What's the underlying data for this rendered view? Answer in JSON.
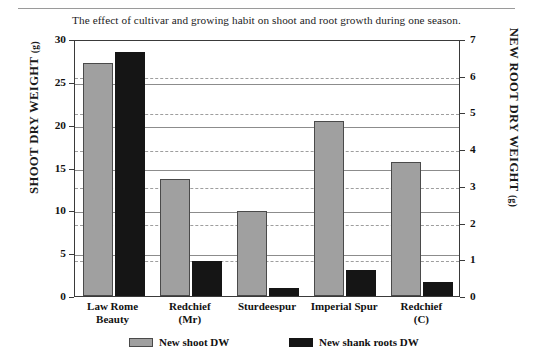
{
  "figure": {
    "caption": "The effect of cultivar and growing habit on shoot and root growth during one season."
  },
  "chart_data": {
    "type": "bar",
    "title": "The effect of cultivar and growing habit on shoot and root growth during one season.",
    "xlabel": "",
    "ylabel": "SHOOT DRY WEIGHT (g)",
    "y2label": "NEW ROOT DRY WEIGHT (g)",
    "categories": [
      "Law Rome Beauty",
      "Redchief (Mr)",
      "Sturdeespur",
      "Imperial Spur",
      "Redchief (C)"
    ],
    "category_lines": [
      [
        "Law Rome",
        "Beauty"
      ],
      [
        "Redchief",
        "(Mr)"
      ],
      [
        "Sturdeespur",
        ""
      ],
      [
        "Imperial Spur",
        ""
      ],
      [
        "Redchief",
        "(C)"
      ]
    ],
    "series": [
      {
        "name": "New shoot DW",
        "axis": "left",
        "color": "#a0a0a0",
        "values": [
          27.2,
          13.7,
          9.9,
          20.4,
          15.6
        ]
      },
      {
        "name": "New shank roots DW",
        "axis": "right",
        "color": "#151515",
        "values": [
          6.65,
          0.95,
          0.22,
          0.7,
          0.38
        ]
      }
    ],
    "ylim": [
      0,
      30
    ],
    "yticks": [
      0,
      5,
      10,
      15,
      20,
      25,
      30
    ],
    "y2lim": [
      0,
      7
    ],
    "y2ticks": [
      0,
      1,
      2,
      3,
      4,
      5,
      6,
      7
    ],
    "grid": {
      "left_axis_solid": true,
      "right_axis_dashed": true
    },
    "legend": {
      "position": "bottom",
      "entries": [
        "New shoot DW",
        "New shank roots DW"
      ]
    }
  },
  "axes": {
    "left": {
      "title_main": "SHOOT DRY WEIGHT",
      "title_unit": "(g)",
      "ticks": [
        "0",
        "5",
        "10",
        "15",
        "20",
        "25",
        "30"
      ]
    },
    "right": {
      "title_main": "NEW ROOT DRY WEIGHT",
      "title_unit": "(g)",
      "ticks": [
        "0",
        "1",
        "2",
        "3",
        "4",
        "5",
        "6",
        "7"
      ]
    }
  },
  "legend": {
    "items": [
      {
        "label": "New shoot DW",
        "color": "#a0a0a0"
      },
      {
        "label": "New shank roots DW",
        "color": "#151515"
      }
    ]
  }
}
